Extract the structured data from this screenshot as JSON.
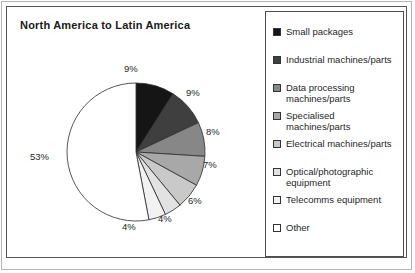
{
  "figure": {
    "title": "North America to Latin America"
  },
  "chart_data": {
    "type": "pie",
    "title": "North America to Latin America",
    "xlabel": "",
    "ylabel": "",
    "unit": "%",
    "grid": false,
    "legend_position": "right",
    "start_angle_deg": 0,
    "direction": "clockwise",
    "categories": [
      "Small packages",
      "Industrial machines/parts",
      "Data processing machines/parts",
      "Specialised machines/parts",
      "Electrical machines/parts",
      "Optical/photographic equipment",
      "Telecomms equipment",
      "Other"
    ],
    "values": [
      9,
      9,
      8,
      7,
      6,
      4,
      4,
      53
    ],
    "value_labels": [
      "9%",
      "9%",
      "8%",
      "7%",
      "6%",
      "4%",
      "4%",
      "53%"
    ],
    "colors": [
      "#151515",
      "#3f3f3f",
      "#878787",
      "#a8a8a8",
      "#c9c9c9",
      "#e2e2e2",
      "#f2f2f2",
      "#ffffff"
    ]
  },
  "legend": {
    "items": [
      {
        "label": "Small packages",
        "color": "#151515"
      },
      {
        "label": "Industrial machines/parts",
        "color": "#3f3f3f"
      },
      {
        "label": "Data processing\nmachines/parts",
        "color": "#878787"
      },
      {
        "label": "Specialised\nmachines/parts",
        "color": "#a8a8a8"
      },
      {
        "label": "Electrical machines/parts",
        "color": "#c9c9c9"
      },
      {
        "label": "Optical/photographic\nequipment",
        "color": "#e2e2e2"
      },
      {
        "label": "Telecomms equipment",
        "color": "#f2f2f2"
      },
      {
        "label": "Other",
        "color": "#ffffff"
      }
    ],
    "row_tops": [
      14,
      42,
      70,
      98,
      126,
      154,
      182,
      210
    ]
  },
  "pie_labels": [
    {
      "text": "9%",
      "left": 114,
      "top": 8
    },
    {
      "text": "9%",
      "left": 176,
      "top": 32
    },
    {
      "text": "8%",
      "left": 196,
      "top": 71
    },
    {
      "text": "7%",
      "left": 193,
      "top": 104
    },
    {
      "text": "6%",
      "left": 178,
      "top": 140
    },
    {
      "text": "4%",
      "left": 148,
      "top": 158
    },
    {
      "text": "4%",
      "left": 112,
      "top": 166
    },
    {
      "text": "53%",
      "left": 20,
      "top": 96
    }
  ]
}
